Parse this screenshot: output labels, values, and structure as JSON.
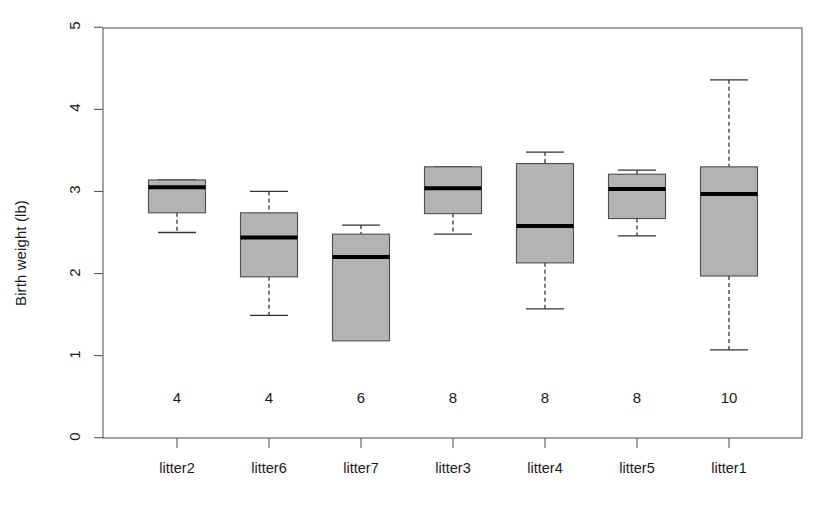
{
  "chart_data": {
    "type": "box",
    "title": "",
    "xlabel": "",
    "ylabel": "Birth weight (lb)",
    "ylim": [
      0,
      5
    ],
    "yticks": [
      "0",
      "1",
      "2",
      "3",
      "4",
      "5"
    ],
    "grid": false,
    "legend": "none",
    "categories": [
      "litter2",
      "litter6",
      "litter7",
      "litter3",
      "litter4",
      "litter5",
      "litter1"
    ],
    "counts": [
      "4",
      "4",
      "6",
      "8",
      "8",
      "8",
      "10"
    ],
    "boxes": [
      {
        "label": "litter2",
        "n": 4,
        "whisker_low": 2.5,
        "q1": 2.74,
        "median": 3.05,
        "q3": 3.14,
        "whisker_high": 3.14
      },
      {
        "label": "litter6",
        "n": 4,
        "whisker_low": 1.49,
        "q1": 1.96,
        "median": 2.44,
        "q3": 2.74,
        "whisker_high": 3.0
      },
      {
        "label": "litter7",
        "n": 6,
        "whisker_low": 1.18,
        "q1": 1.18,
        "median": 2.2,
        "q3": 2.48,
        "whisker_high": 2.59
      },
      {
        "label": "litter3",
        "n": 8,
        "whisker_low": 2.48,
        "q1": 2.73,
        "median": 3.04,
        "q3": 3.3,
        "whisker_high": 3.3
      },
      {
        "label": "litter4",
        "n": 8,
        "whisker_low": 1.57,
        "q1": 2.13,
        "median": 2.58,
        "q3": 3.34,
        "whisker_high": 3.48
      },
      {
        "label": "litter5",
        "n": 8,
        "whisker_low": 2.46,
        "q1": 2.67,
        "median": 3.03,
        "q3": 3.21,
        "whisker_high": 3.26
      },
      {
        "label": "litter1",
        "n": 10,
        "whisker_low": 1.07,
        "q1": 1.97,
        "median": 2.97,
        "q3": 3.3,
        "whisker_high": 4.36
      }
    ],
    "style": {
      "box_fill": "#b3b3b3",
      "box_stroke": "#4d4d4d",
      "median_color": "#000000",
      "axis_color": "#595959",
      "text_color": "#1a1a1a"
    }
  }
}
